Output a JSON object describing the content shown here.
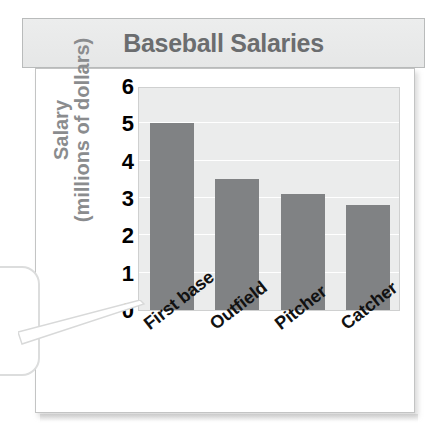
{
  "title": {
    "text": "Baseball Salaries"
  },
  "axes": {
    "ylabel_line1": "Salary",
    "ylabel_line2": "(millions of dollars)",
    "yticks": [
      "6",
      "5",
      "4",
      "3",
      "2",
      "1",
      "0"
    ],
    "xlabels": [
      "First base",
      "Outfield",
      "Pitcher",
      "Catcher"
    ]
  },
  "colors": {
    "bar": "#808284",
    "plot_background": "#ebecec",
    "gridline": "#ffffff",
    "title_text": "#6b6d6f",
    "title_background": "#eceded",
    "axis_label_text": "#8a8c8e",
    "tick_text": "#000000",
    "frame_border": "#c3c4c4"
  },
  "chart_data": {
    "type": "bar",
    "title": "Baseball Salaries",
    "xlabel": "",
    "ylabel": "Salary (millions of dollars)",
    "categories": [
      "First base",
      "Outfield",
      "Pitcher",
      "Catcher"
    ],
    "values": [
      5.0,
      3.5,
      3.1,
      2.8
    ],
    "ylim": [
      0,
      6
    ],
    "ytick_values": [
      0,
      1,
      2,
      3,
      4,
      5,
      6
    ],
    "grid": true,
    "grid_axis": "y",
    "legend": false,
    "bar_color": "#808284",
    "units": "millions of dollars"
  },
  "callout": {
    "present": true,
    "shape": "rounded-rectangle",
    "pointer_target": "y-axis zero tick"
  }
}
